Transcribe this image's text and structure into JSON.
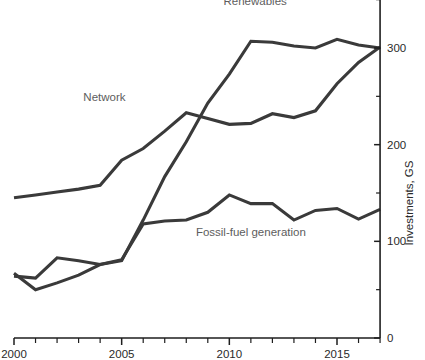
{
  "chart_data": {
    "type": "line",
    "title": "",
    "xlabel": "",
    "ylabel": "Investments, GS",
    "xlim": [
      2000,
      2017
    ],
    "ylim": [
      0,
      360
    ],
    "grid": false,
    "legend_position": "inline-labels",
    "x": [
      2000,
      2001,
      2002,
      2003,
      2004,
      2005,
      2006,
      2007,
      2008,
      2009,
      2010,
      2011,
      2012,
      2013,
      2014,
      2015,
      2016,
      2017
    ],
    "xticks_major": [
      2000,
      2005,
      2010,
      2015
    ],
    "xtick_labels": [
      "2000",
      "2005",
      "2010",
      "2015"
    ],
    "yticks_major": [
      0,
      100,
      200,
      300
    ],
    "ytick_labels": [
      "0",
      "100",
      "200",
      "300"
    ],
    "yticks_minor": [
      50,
      150,
      250,
      350
    ],
    "series": [
      {
        "name": "Renewables",
        "label_x": 2011.2,
        "label_y": 345,
        "values": [
          67,
          50,
          57,
          65,
          76,
          80,
          122,
          167,
          203,
          243,
          273,
          307,
          306,
          302,
          300,
          309,
          303,
          300
        ]
      },
      {
        "name": "Network",
        "label_x": 2004.2,
        "label_y": 245,
        "values": [
          145,
          148,
          151,
          154,
          158,
          184,
          196,
          214,
          233,
          227,
          221,
          222,
          232,
          228,
          235,
          263,
          285,
          301
        ]
      },
      {
        "name": "Fossil-fuel generation",
        "label_x": 2011.0,
        "label_y": 106,
        "values": [
          64,
          62,
          83,
          80,
          76,
          81,
          118,
          121,
          122,
          130,
          148,
          139,
          139,
          122,
          132,
          134,
          123,
          133
        ]
      }
    ]
  },
  "axis": {
    "y_title": "Investments, GS"
  }
}
